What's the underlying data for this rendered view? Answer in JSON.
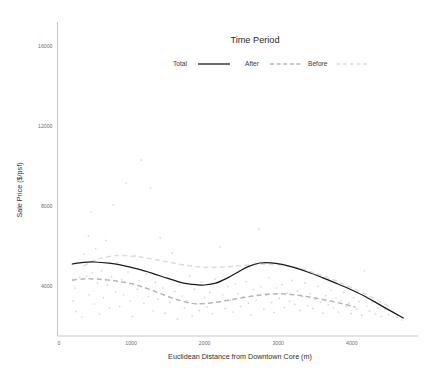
{
  "chart_data": {
    "type": "scatter",
    "title": "",
    "xlabel": "Euclidean Distance from Downtown Core (m)",
    "ylabel": "Sale Price ($/psf)",
    "xlim": [
      0,
      4900
    ],
    "ylim": [
      1500,
      17200
    ],
    "xticks": [
      0,
      1000,
      2000,
      3000,
      4000
    ],
    "xtick_labels": [
      "0",
      "1000",
      "2000",
      "3000",
      "4000"
    ],
    "yticks": [
      4000,
      8000,
      12000,
      16000
    ],
    "ytick_labels": [
      "4000",
      "8000",
      "12000",
      "16000"
    ],
    "grid": false,
    "legend": {
      "title": "Time Period",
      "position": "top-center",
      "entries": [
        {
          "label": "Total",
          "style": "solid",
          "color": "#1a1a1a"
        },
        {
          "label": "After",
          "style": "dashed",
          "color": "#b6b6b6"
        },
        {
          "label": "Before",
          "style": "dashed",
          "color": "#dcdcdc"
        }
      ]
    },
    "series": [
      {
        "name": "Total",
        "style": "solid",
        "color": "#1a1a1a",
        "x": [
          200,
          350,
          500,
          700,
          900,
          1100,
          1300,
          1500,
          1700,
          1900,
          2000,
          2150,
          2300,
          2450,
          2600,
          2750,
          2900,
          3050,
          3200,
          3400,
          3600,
          3800,
          4000,
          4200,
          4400,
          4700
        ],
        "y": [
          5100,
          5180,
          5200,
          5140,
          5020,
          4840,
          4620,
          4380,
          4160,
          4060,
          4050,
          4140,
          4380,
          4690,
          4980,
          5150,
          5160,
          5080,
          4940,
          4700,
          4420,
          4120,
          3800,
          3440,
          3020,
          2400
        ]
      },
      {
        "name": "After",
        "style": "dashed",
        "color": "#b6b6b6",
        "x": [
          200,
          400,
          600,
          800,
          1000,
          1200,
          1400,
          1600,
          1800,
          1900,
          2100,
          2300,
          2500,
          2700,
          2900,
          3100,
          3300,
          3500,
          3700,
          3900,
          4050
        ],
        "y": [
          4300,
          4360,
          4330,
          4250,
          4120,
          3900,
          3620,
          3350,
          3150,
          3110,
          3160,
          3280,
          3400,
          3520,
          3600,
          3600,
          3520,
          3400,
          3260,
          3090,
          2950
        ]
      },
      {
        "name": "Before",
        "style": "dashed",
        "color": "#dcdcdc",
        "x": [
          350,
          550,
          750,
          900,
          1100,
          1300,
          1500,
          1700,
          1900,
          2100,
          2300,
          2500,
          2700,
          2900,
          3100,
          3300,
          3500,
          3700,
          3900,
          4100,
          4300,
          4550
        ],
        "y": [
          5000,
          5350,
          5500,
          5520,
          5460,
          5340,
          5200,
          5060,
          4960,
          4930,
          4960,
          5020,
          5080,
          5090,
          5020,
          4860,
          4640,
          4380,
          4080,
          3740,
          3380,
          2900
        ]
      }
    ],
    "points": [
      [
        205,
        4280
      ],
      [
        215,
        3240
      ],
      [
        240,
        3900
      ],
      [
        255,
        2720
      ],
      [
        300,
        4420
      ],
      [
        330,
        2450
      ],
      [
        360,
        5600
      ],
      [
        395,
        4500
      ],
      [
        420,
        6500
      ],
      [
        430,
        3560
      ],
      [
        455,
        7700
      ],
      [
        470,
        4660
      ],
      [
        500,
        3100
      ],
      [
        520,
        5880
      ],
      [
        545,
        4150
      ],
      [
        570,
        2600
      ],
      [
        600,
        4760
      ],
      [
        625,
        3420
      ],
      [
        655,
        6280
      ],
      [
        680,
        4050
      ],
      [
        705,
        2890
      ],
      [
        735,
        4480
      ],
      [
        760,
        8060
      ],
      [
        790,
        3700
      ],
      [
        815,
        5180
      ],
      [
        845,
        2980
      ],
      [
        870,
        4320
      ],
      [
        900,
        3560
      ],
      [
        935,
        9150
      ],
      [
        960,
        4700
      ],
      [
        990,
        3250
      ],
      [
        1020,
        2480
      ],
      [
        1050,
        5520
      ],
      [
        1085,
        3840
      ],
      [
        1110,
        4260
      ],
      [
        1140,
        10300
      ],
      [
        1175,
        3120
      ],
      [
        1200,
        4600
      ],
      [
        1235,
        3480
      ],
      [
        1265,
        8900
      ],
      [
        1300,
        2760
      ],
      [
        1330,
        4180
      ],
      [
        1365,
        3340
      ],
      [
        1395,
        6420
      ],
      [
        1430,
        3900
      ],
      [
        1465,
        2630
      ],
      [
        1495,
        4420
      ],
      [
        1530,
        3180
      ],
      [
        1560,
        5640
      ],
      [
        1595,
        3720
      ],
      [
        1630,
        2340
      ],
      [
        1660,
        4060
      ],
      [
        1695,
        3500
      ],
      [
        1725,
        2900
      ],
      [
        1760,
        3260
      ],
      [
        1795,
        4480
      ],
      [
        1830,
        2520
      ],
      [
        1860,
        3840
      ],
      [
        1895,
        3100
      ],
      [
        1930,
        2780
      ],
      [
        1965,
        4200
      ],
      [
        2000,
        3420
      ],
      [
        2035,
        2960
      ],
      [
        2070,
        3680
      ],
      [
        2105,
        2620
      ],
      [
        2140,
        4340
      ],
      [
        2175,
        3200
      ],
      [
        2210,
        5960
      ],
      [
        2245,
        3560
      ],
      [
        2280,
        2880
      ],
      [
        2315,
        3980
      ],
      [
        2350,
        3300
      ],
      [
        2385,
        2700
      ],
      [
        2420,
        4100
      ],
      [
        2455,
        3620
      ],
      [
        2490,
        2980
      ],
      [
        2525,
        3460
      ],
      [
        2560,
        4220
      ],
      [
        2595,
        3140
      ],
      [
        2630,
        2560
      ],
      [
        2665,
        3820
      ],
      [
        2700,
        3300
      ],
      [
        2735,
        6860
      ],
      [
        2770,
        3960
      ],
      [
        2805,
        2840
      ],
      [
        2840,
        3540
      ],
      [
        2875,
        4420
      ],
      [
        2910,
        3180
      ],
      [
        2945,
        2680
      ],
      [
        2980,
        3900
      ],
      [
        3015,
        3380
      ],
      [
        3050,
        4060
      ],
      [
        3085,
        2920
      ],
      [
        3120,
        3660
      ],
      [
        3155,
        3240
      ],
      [
        3190,
        4280
      ],
      [
        3225,
        3080
      ],
      [
        3260,
        3740
      ],
      [
        3295,
        2780
      ],
      [
        3330,
        3480
      ],
      [
        3365,
        4140
      ],
      [
        3400,
        3020
      ],
      [
        3435,
        3620
      ],
      [
        3470,
        2880
      ],
      [
        3505,
        3340
      ],
      [
        3540,
        3980
      ],
      [
        3575,
        3180
      ],
      [
        3610,
        2640
      ],
      [
        3645,
        3520
      ],
      [
        3680,
        3060
      ],
      [
        3715,
        3800
      ],
      [
        3750,
        2900
      ],
      [
        3785,
        3400
      ],
      [
        3820,
        2700
      ],
      [
        3855,
        3260
      ],
      [
        3890,
        3680
      ],
      [
        3925,
        2980
      ],
      [
        3960,
        3140
      ],
      [
        3995,
        2620
      ],
      [
        4030,
        3420
      ],
      [
        4065,
        2860
      ],
      [
        4100,
        3220
      ],
      [
        4135,
        2540
      ],
      [
        4170,
        4760
      ],
      [
        4205,
        3000
      ],
      [
        4240,
        2740
      ],
      [
        4280,
        3180
      ],
      [
        4320,
        2600
      ],
      [
        4360,
        2900
      ],
      [
        4400,
        2480
      ],
      [
        4450,
        2820
      ],
      [
        4500,
        2560
      ],
      [
        4560,
        2700
      ],
      [
        4620,
        2420
      ],
      [
        4680,
        2300
      ]
    ]
  }
}
